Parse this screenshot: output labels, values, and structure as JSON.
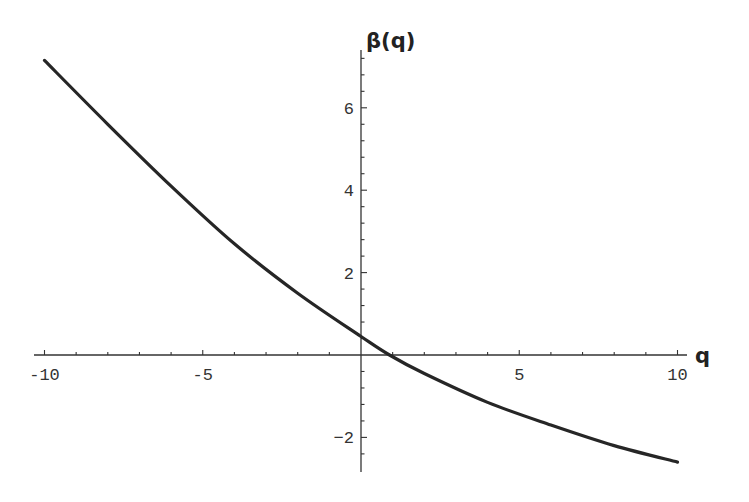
{
  "chart_data": {
    "type": "line",
    "title": "",
    "xlabel": "q",
    "ylabel": "β(q)",
    "xlim": [
      -10,
      10
    ],
    "ylim": [
      -2.9,
      7.4
    ],
    "grid": false,
    "legend": null,
    "x_ticks": [
      "-10",
      "-5",
      "5",
      "10"
    ],
    "y_ticks": [
      "-2",
      "2",
      "4",
      "6"
    ],
    "series": [
      {
        "name": "β(q)",
        "x": [
          -10,
          -8,
          -6,
          -4,
          -2,
          0,
          0.9,
          2,
          4,
          6,
          8,
          10
        ],
        "y": [
          7.15,
          5.6,
          4.1,
          2.7,
          1.5,
          0.45,
          0.0,
          -0.45,
          -1.15,
          -1.7,
          -2.2,
          -2.6
        ]
      }
    ]
  }
}
